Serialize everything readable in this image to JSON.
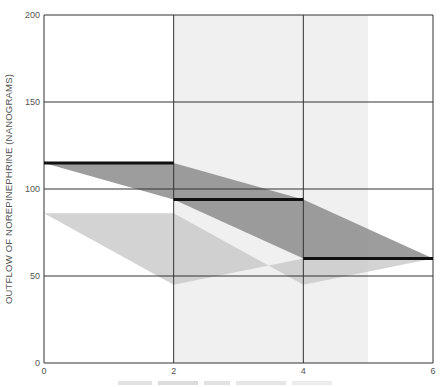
{
  "chart_data": {
    "type": "line",
    "title": "",
    "xlabel": "",
    "ylabel": "OUTFLOW OF NOREPINEPHRINE (NANOGRAMS)",
    "xlim": [
      0,
      6
    ],
    "ylim": [
      0,
      200
    ],
    "x_ticks": [
      "0",
      "2",
      "4",
      "6"
    ],
    "y_ticks": [
      "0",
      "50",
      "100",
      "150",
      "200"
    ],
    "grid": true,
    "legend": null,
    "shaded_x_band": {
      "from": 2,
      "to": 5,
      "color": "#f0f0f0"
    },
    "series": [
      {
        "name": "step-mean",
        "style": "step",
        "color": "#111111",
        "segments": [
          {
            "x": [
              0,
              2
            ],
            "y": 115
          },
          {
            "x": [
              2,
              4
            ],
            "y": 94
          },
          {
            "x": [
              4,
              6
            ],
            "y": 60
          }
        ]
      },
      {
        "name": "dark-range-band",
        "style": "area",
        "color": "#8c8c8c",
        "polygon": [
          [
            0,
            115
          ],
          [
            2,
            115
          ],
          [
            4,
            94
          ],
          [
            6,
            60
          ],
          [
            4,
            60
          ],
          [
            2,
            94
          ],
          [
            0,
            115
          ]
        ]
      },
      {
        "name": "light-range-band",
        "style": "area",
        "color": "#c8c8c8",
        "polygon": [
          [
            0,
            86
          ],
          [
            2,
            86
          ],
          [
            4,
            45
          ],
          [
            6,
            60
          ],
          [
            4,
            60
          ],
          [
            2,
            45
          ],
          [
            0,
            86
          ]
        ]
      }
    ]
  },
  "axes": {
    "y_label": "OUTFLOW OF NOREPINEPHRINE (NANOGRAMS)",
    "x_label_partial": ""
  }
}
